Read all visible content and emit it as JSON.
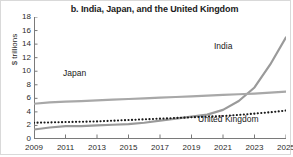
{
  "figure": {
    "title": "b. India, Japan, and the United Kingdom",
    "y_axis_title": "$ trillions"
  },
  "chart_data": {
    "type": "line",
    "title": "b. India, Japan, and the United Kingdom",
    "xlabel": "",
    "ylabel": "$ trillions",
    "xlim": [
      2009,
      2025
    ],
    "ylim": [
      0,
      18
    ],
    "ytick_values": [
      0,
      2,
      4,
      6,
      8,
      10,
      12,
      14,
      16,
      18
    ],
    "ytick_labels": [
      "0",
      "2",
      "4",
      "6",
      "8",
      "10",
      "12",
      "14",
      "16",
      "18"
    ],
    "xtick_values": [
      2009,
      2011,
      2013,
      2015,
      2017,
      2019,
      2021,
      2023,
      2025
    ],
    "xtick_labels": [
      "2009",
      "2011",
      "2013",
      "2015",
      "2017",
      "2019",
      "2021",
      "2023",
      "2025"
    ],
    "grid": false,
    "legend": "inline-labels",
    "x": [
      2009,
      2010,
      2011,
      2012,
      2013,
      2014,
      2015,
      2016,
      2017,
      2018,
      2019,
      2020,
      2021,
      2022,
      2023,
      2024,
      2025
    ],
    "series": [
      {
        "name": "India",
        "style": "solid",
        "color": "#9a9a9a",
        "label": "India",
        "values": [
          1.4,
          1.7,
          1.9,
          1.9,
          2.0,
          2.1,
          2.2,
          2.4,
          2.7,
          3.0,
          3.3,
          3.6,
          4.3,
          5.6,
          7.6,
          11.0,
          15.0
        ]
      },
      {
        "name": "Japan",
        "style": "solid",
        "color": "#a8a8a8",
        "label": "Japan",
        "values": [
          5.2,
          5.4,
          5.5,
          5.6,
          5.7,
          5.8,
          5.9,
          6.0,
          6.1,
          6.2,
          6.3,
          6.4,
          6.5,
          6.6,
          6.7,
          6.85,
          7.0
        ]
      },
      {
        "name": "United Kingdom",
        "style": "dotted",
        "color": "#1a1a1a",
        "label": "United Kingdom",
        "values": [
          2.4,
          2.45,
          2.5,
          2.55,
          2.6,
          2.7,
          2.8,
          2.9,
          3.0,
          3.1,
          3.2,
          3.3,
          3.4,
          3.55,
          3.75,
          3.95,
          4.2
        ]
      }
    ]
  },
  "colors": {
    "line_gray": "#9a9a9a",
    "axis": "#7a7a7a",
    "text": "#2b2b2b",
    "border": "#d9d9d9"
  }
}
